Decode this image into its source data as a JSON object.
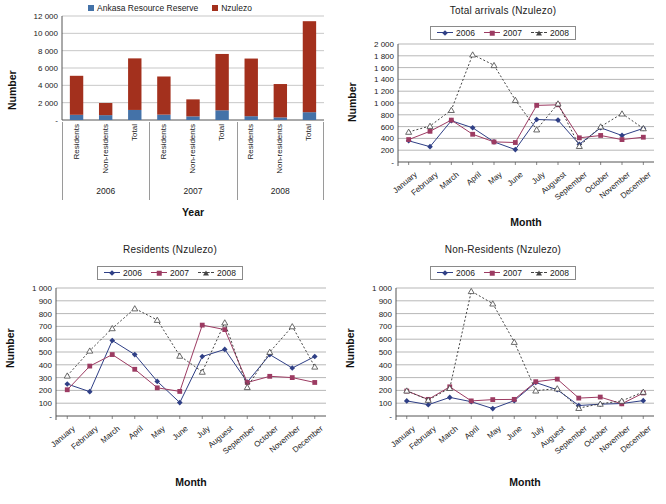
{
  "colors": {
    "ankasa": "#4472a8",
    "nzulezo": "#a3301d",
    "y2006": "#2f3f86",
    "y2007": "#9c3b62",
    "y2008": "#444444",
    "grid": "#999999",
    "axis": "#555555"
  },
  "bar_panel": {
    "legend": [
      {
        "label": "Ankasa Resource Reserve",
        "color": "#4472a8",
        "icon": "square-swatch"
      },
      {
        "label": "Nzulezo",
        "color": "#a3301d",
        "icon": "square-swatch"
      }
    ],
    "ylabel": "Number",
    "xlabel": "Year"
  },
  "months": [
    "January",
    "February",
    "March",
    "April",
    "May",
    "June",
    "July",
    "Auguest",
    "September",
    "October",
    "November",
    "December"
  ],
  "line_legend": [
    {
      "label": "2006",
      "color": "#2f3f86",
      "marker": "diamond",
      "style": "solid"
    },
    {
      "label": "2007",
      "color": "#9c3b62",
      "marker": "square",
      "style": "solid"
    },
    {
      "label": "2008",
      "color": "#444444",
      "marker": "triangle",
      "style": "dashed"
    }
  ],
  "common": {
    "ylabel": "Number",
    "xlabel": "Month"
  },
  "chart_data": [
    {
      "type": "bar",
      "id": "stacked-visitors-by-year",
      "title": "",
      "xlabel": "Year",
      "ylabel": "Number",
      "ylim": [
        0,
        12000
      ],
      "yticks": [
        "-",
        "2 000",
        "4 000",
        "6 000",
        "8 000",
        "10 000",
        "12 000"
      ],
      "grid": true,
      "legend_position": "top-center",
      "stacked": true,
      "categories": [
        "Residents 2006",
        "Non-residents 2006",
        "Total 2006",
        "Residents 2007",
        "Non-residents 2007",
        "Total 2007",
        "Residents 2008",
        "Non-residents 2008",
        "Total 2008"
      ],
      "category_labels": [
        "Residents",
        "Non-residents",
        "Total",
        "Residents",
        "Non-residents",
        "Total",
        "Residents",
        "Non-residents",
        "Total"
      ],
      "groups": [
        "2006",
        "2007",
        "2008"
      ],
      "series": [
        {
          "name": "Ankasa Resource Reserve",
          "color": "#4472a8",
          "values": [
            600,
            560,
            1160,
            620,
            420,
            1120,
            440,
            300,
            900
          ]
        },
        {
          "name": "Nzulezo",
          "color": "#a3301d",
          "values": [
            4500,
            1400,
            5950,
            4400,
            1960,
            6500,
            6650,
            3850,
            10500
          ]
        }
      ],
      "totals": [
        5100,
        1960,
        7110,
        5020,
        2380,
        7620,
        7090,
        4150,
        11400
      ]
    },
    {
      "type": "line",
      "id": "total-arrivals-nzulezo",
      "title": "Total arrivals (Nzulezo)",
      "xlabel": "Month",
      "ylabel": "Number",
      "ylim": [
        0,
        2000
      ],
      "yticks": [
        "-",
        "200",
        "400",
        "600",
        "800",
        "1 000",
        "1 200",
        "1 400",
        "1 600",
        "1 800",
        "2 000"
      ],
      "grid": true,
      "legend_position": "top-center",
      "categories": [
        "January",
        "February",
        "March",
        "April",
        "May",
        "June",
        "July",
        "Auguest",
        "September",
        "October",
        "November",
        "December"
      ],
      "series": [
        {
          "name": "2006",
          "color": "#2f3f86",
          "marker": "diamond",
          "style": "solid",
          "values": [
            360,
            260,
            700,
            580,
            340,
            210,
            720,
            710,
            300,
            580,
            450,
            570
          ]
        },
        {
          "name": "2007",
          "color": "#9c3b62",
          "marker": "square",
          "style": "solid",
          "values": [
            380,
            520,
            710,
            470,
            340,
            330,
            960,
            970,
            410,
            450,
            380,
            420
          ]
        },
        {
          "name": "2008",
          "color": "#444444",
          "marker": "triangle",
          "style": "dashed",
          "values": [
            510,
            610,
            880,
            1820,
            1640,
            1050,
            550,
            990,
            270,
            600,
            820,
            570
          ]
        }
      ]
    },
    {
      "type": "line",
      "id": "residents-nzulezo",
      "title": "Residents (Nzulezo)",
      "xlabel": "Month",
      "ylabel": "Number",
      "ylim": [
        0,
        1000
      ],
      "yticks": [
        "-",
        "100",
        "200",
        "300",
        "400",
        "500",
        "600",
        "700",
        "800",
        "900",
        "1 000"
      ],
      "grid": true,
      "legend_position": "top-center",
      "categories": [
        "January",
        "February",
        "March",
        "April",
        "May",
        "June",
        "July",
        "Auguest",
        "September",
        "October",
        "November",
        "December"
      ],
      "series": [
        {
          "name": "2006",
          "color": "#2f3f86",
          "marker": "diamond",
          "style": "solid",
          "values": [
            250,
            190,
            590,
            480,
            270,
            105,
            465,
            520,
            265,
            480,
            375,
            465
          ]
        },
        {
          "name": "2007",
          "color": "#9c3b62",
          "marker": "square",
          "style": "solid",
          "values": [
            205,
            390,
            480,
            365,
            220,
            192,
            710,
            675,
            262,
            310,
            300,
            262
          ]
        },
        {
          "name": "2008",
          "color": "#444444",
          "marker": "triangle",
          "style": "dashed",
          "values": [
            315,
            510,
            685,
            840,
            750,
            470,
            345,
            730,
            225,
            500,
            700,
            385
          ]
        }
      ]
    },
    {
      "type": "line",
      "id": "non-residents-nzulezo",
      "title": "Non-Residents (Nzulezo)",
      "xlabel": "Month",
      "ylabel": "Number",
      "ylim": [
        0,
        1000
      ],
      "yticks": [
        "-",
        "100",
        "200",
        "300",
        "400",
        "500",
        "600",
        "700",
        "800",
        "900",
        "1 000"
      ],
      "grid": true,
      "legend_position": "top-center",
      "categories": [
        "January",
        "February",
        "March",
        "April",
        "May",
        "June",
        "July",
        "Auguest",
        "September",
        "October",
        "November",
        "December"
      ],
      "series": [
        {
          "name": "2006",
          "color": "#2f3f86",
          "marker": "diamond",
          "style": "solid",
          "values": [
            118,
            88,
            145,
            112,
            58,
            120,
            262,
            205,
            82,
            92,
            98,
            120
          ]
        },
        {
          "name": "2007",
          "color": "#9c3b62",
          "marker": "square",
          "style": "solid",
          "values": [
            195,
            130,
            228,
            118,
            128,
            130,
            268,
            288,
            140,
            148,
            95,
            180
          ]
        },
        {
          "name": "2008",
          "color": "#444444",
          "marker": "triangle",
          "style": "dashed",
          "values": [
            198,
            125,
            218,
            975,
            878,
            578,
            198,
            215,
            62,
            95,
            118,
            188
          ]
        }
      ]
    }
  ]
}
